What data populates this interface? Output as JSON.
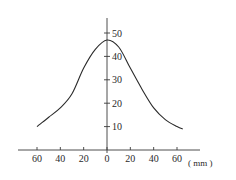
{
  "chart_data": {
    "type": "line",
    "title": "",
    "xlabel": "(mm)",
    "ylabel": "",
    "x_tick_labels": [
      "60",
      "40",
      "20",
      "0",
      "20",
      "40",
      "60"
    ],
    "x_tick_values": [
      -60,
      -40,
      -20,
      0,
      20,
      40,
      60
    ],
    "y_tick_labels": [
      "10",
      "20",
      "30",
      "40",
      "50"
    ],
    "y_tick_values": [
      10,
      20,
      30,
      40,
      50
    ],
    "xlim": [
      -75,
      75
    ],
    "ylim": [
      0,
      55
    ],
    "grid": false,
    "legend": null,
    "series": [
      {
        "name": "curve",
        "x": [
          -60,
          -50,
          -40,
          -30,
          -20,
          -10,
          0,
          10,
          20,
          30,
          40,
          50,
          60,
          65
        ],
        "y": [
          10,
          14,
          18,
          24,
          35,
          43,
          47,
          44,
          35,
          26,
          18,
          13,
          10,
          9
        ]
      }
    ]
  },
  "axis": {
    "unit_label": "( mm )"
  }
}
